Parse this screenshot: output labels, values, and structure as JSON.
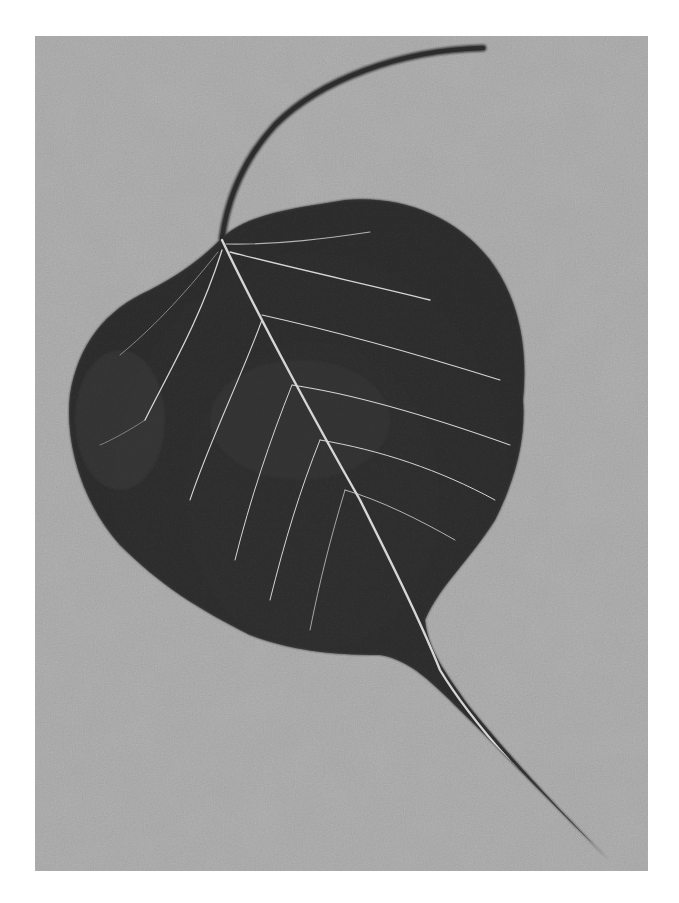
{
  "image": {
    "kind": "photograph",
    "subject": "Bodhi (peepal) leaf with long stem and drip tip",
    "tone": "grayscale",
    "colors": {
      "page_border": "#ffffff",
      "background": "#a9a9a9",
      "background_light": "#b9b9b9",
      "leaf": "#2e2e2e",
      "leaf_dark": "#1e1e1e",
      "stem": "#333333",
      "vein": "#d8d8d8"
    },
    "frame": {
      "x": 35,
      "y": 36,
      "width": 613,
      "height": 835
    }
  }
}
